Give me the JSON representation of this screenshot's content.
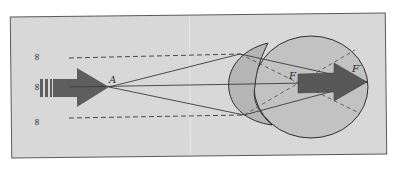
{
  "diagram": {
    "labels": {
      "infinity_top": "∞",
      "infinity_middle": "∞",
      "infinity_bottom": "∞",
      "point_A": "A",
      "focus_F": "F",
      "focus_F_prime": "F′"
    },
    "colors": {
      "background": "#ffffff",
      "panel": "#d8d8d8",
      "panel_border": "#555555",
      "arrow_fill": "#5e5e5e",
      "eye_fill": "#bdbdbd",
      "cornea_fill": "#b3b3b3",
      "line": "#3c3c3c",
      "dashed": "#4a4a4a"
    }
  }
}
